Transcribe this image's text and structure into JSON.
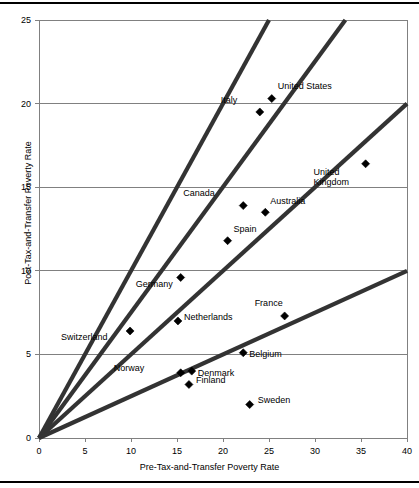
{
  "chart_data": {
    "type": "scatter",
    "title": "",
    "xlabel": "Pre-Tax-and-Transfer Poverty Rate",
    "ylabel": "Post-Tax-and-Transfer Poverty Rate",
    "xlim": [
      0,
      40
    ],
    "ylim": [
      0,
      25
    ],
    "xticks": [
      "0",
      "5",
      "10",
      "15",
      "20",
      "25",
      "30",
      "35",
      "40"
    ],
    "yticks": [
      "0",
      "5",
      "10",
      "15",
      "20",
      "25"
    ],
    "grid": "horizontal",
    "legend": "none",
    "marker": "diamond",
    "marker_color": "#000000",
    "points": [
      {
        "label": "United States",
        "x": 25.3,
        "y": 20.3,
        "label_dx": 6,
        "label_dy": -13
      },
      {
        "label": "Italy",
        "x": 24.0,
        "y": 19.5,
        "label_dx": -22,
        "label_dy": -12
      },
      {
        "label": "United Kingdom",
        "x": 35.5,
        "y": 16.4,
        "label_dx": -4,
        "label_dy": 8
      },
      {
        "label": "Canada",
        "x": 22.2,
        "y": 13.9,
        "label_dx": -28,
        "label_dy": -13
      },
      {
        "label": "Australia",
        "x": 24.6,
        "y": 13.5,
        "label_dx": 5,
        "label_dy": -11
      },
      {
        "label": "Spain",
        "x": 20.5,
        "y": 11.8,
        "label_dx": 6,
        "label_dy": -12
      },
      {
        "label": "Germany",
        "x": 15.4,
        "y": 9.6,
        "label_dx": -8,
        "label_dy": 7
      },
      {
        "label": "France",
        "x": 26.7,
        "y": 7.3,
        "label_dx": -2,
        "label_dy": -13
      },
      {
        "label": "Netherlands",
        "x": 15.1,
        "y": 7.0,
        "label_dx": 6,
        "label_dy": -4
      },
      {
        "label": "Switzerland",
        "x": 9.9,
        "y": 6.4,
        "label_dx": -22,
        "label_dy": 6
      },
      {
        "label": "Belgium",
        "x": 22.2,
        "y": 5.1,
        "label_dx": 6,
        "label_dy": 1
      },
      {
        "label": "Norway",
        "x": 15.4,
        "y": 3.9,
        "label_dx": -36,
        "label_dy": -5
      },
      {
        "label": "Denmark",
        "x": 16.6,
        "y": 4.0,
        "label_dx": 6,
        "label_dy": 2
      },
      {
        "label": "Finland",
        "x": 16.3,
        "y": 3.2,
        "label_dx": 7,
        "label_dy": -4
      },
      {
        "label": "Sweden",
        "x": 22.9,
        "y": 2.0,
        "label_dx": 8,
        "label_dy": -5
      }
    ],
    "reference_lines": [
      {
        "name": "ray-slope-1.00",
        "slope": 1.0,
        "from": [
          0,
          0
        ],
        "to": [
          25,
          25
        ]
      },
      {
        "name": "ray-slope-0.75",
        "slope": 0.75,
        "from": [
          0,
          0
        ],
        "to": [
          33.3,
          25
        ]
      },
      {
        "name": "ray-slope-0.50",
        "slope": 0.5,
        "from": [
          0,
          0
        ],
        "to": [
          40,
          20
        ]
      },
      {
        "name": "ray-slope-0.25",
        "slope": 0.25,
        "from": [
          0,
          0
        ],
        "to": [
          40,
          10
        ]
      }
    ],
    "axis_color": "#808080",
    "grid_color": "#808080",
    "line_color": "#333333"
  }
}
